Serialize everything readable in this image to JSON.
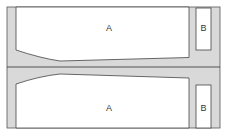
{
  "diagram": {
    "colors": {
      "background": "#ffffff",
      "fill_gray": "#d9d9d9",
      "stroke": "#444444",
      "box_fill": "#ffffff"
    },
    "regions": [
      {
        "id": "top-a",
        "label": "A"
      },
      {
        "id": "top-b",
        "label": "B"
      },
      {
        "id": "bottom-a",
        "label": "A"
      },
      {
        "id": "bottom-b",
        "label": "B"
      }
    ]
  }
}
